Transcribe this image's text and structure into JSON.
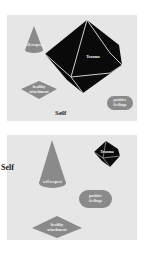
{
  "panels": [
    {
      "id": "top",
      "self_label": "Self",
      "shapes": {
        "cone": {
          "label": "self respect",
          "color": "#8a8a8a"
        },
        "octahedron": {
          "label": "Trauma",
          "color": "#0a0a0a"
        },
        "diamond": {
          "label": "healthy\nattachment",
          "color": "#8a8a8a"
        },
        "pill": {
          "label": "positive\nfeelings",
          "color": "#8a8a8a"
        }
      }
    },
    {
      "id": "bottom",
      "self_label": "Self",
      "shapes": {
        "cone": {
          "label": "self respect",
          "color": "#8a8a8a"
        },
        "octahedron": {
          "label": "Trauma",
          "color": "#0a0a0a"
        },
        "diamond": {
          "label": "healthy\nattachment",
          "color": "#8a8a8a"
        },
        "pill": {
          "label": "positive\nfeelings",
          "color": "#8a8a8a"
        }
      }
    }
  ]
}
